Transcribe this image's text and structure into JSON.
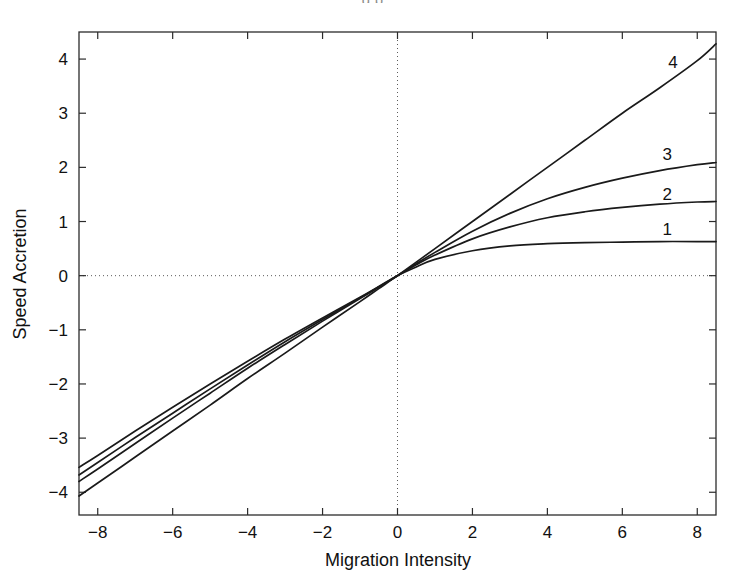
{
  "figure": {
    "background": "#ffffff",
    "ink_color": "#1a1a1a",
    "clipped_top_text": "g p"
  },
  "chart_data": {
    "type": "line",
    "title": "",
    "xlabel": "Migration Intensity",
    "ylabel": "Speed Accretion",
    "xlim": [
      -8.5,
      8.5
    ],
    "ylim": [
      -4.42,
      4.5
    ],
    "xticks": [
      -8,
      -6,
      -4,
      -2,
      0,
      2,
      4,
      6,
      8
    ],
    "xtick_labels": [
      "-8",
      "-6",
      "-4",
      "-2",
      "0",
      "2",
      "4",
      "6",
      "8"
    ],
    "yticks": [
      -4,
      -3,
      -2,
      -1,
      0,
      1,
      2,
      3,
      4
    ],
    "ytick_labels": [
      "-4",
      "-3",
      "-2",
      "-1",
      "0",
      "1",
      "2",
      "3",
      "4"
    ],
    "grid": false,
    "reference_lines": [
      {
        "axis": "x",
        "value": 0,
        "style": "dotted"
      },
      {
        "axis": "y",
        "value": 0,
        "style": "dotted"
      }
    ],
    "legend_position": "inline-right-end-labels",
    "x": [
      -8.5,
      -8,
      -7,
      -6,
      -5,
      -4,
      -3,
      -2,
      -1,
      -0.5,
      0,
      0.5,
      1,
      2,
      3,
      4,
      5,
      6,
      7,
      8,
      8.5
    ],
    "series": [
      {
        "name": "1",
        "label": "1",
        "label_x": 7.2,
        "label_y": 0.86,
        "color": "#1a1a1a",
        "values": [
          -3.54,
          -3.32,
          -2.87,
          -2.43,
          -2.0,
          -1.58,
          -1.17,
          -0.78,
          -0.4,
          -0.2,
          0.0,
          0.16,
          0.3,
          0.46,
          0.55,
          0.59,
          0.61,
          0.62,
          0.63,
          0.63,
          0.63
        ]
      },
      {
        "name": "2",
        "label": "2",
        "label_x": 7.2,
        "label_y": 1.5,
        "color": "#1a1a1a",
        "values": [
          -3.68,
          -3.45,
          -2.99,
          -2.54,
          -2.09,
          -1.65,
          -1.22,
          -0.81,
          -0.41,
          -0.21,
          0.0,
          0.2,
          0.38,
          0.68,
          0.9,
          1.07,
          1.18,
          1.26,
          1.32,
          1.36,
          1.37
        ]
      },
      {
        "name": "3",
        "label": "3",
        "label_x": 7.2,
        "label_y": 2.25,
        "color": "#1a1a1a",
        "values": [
          -3.8,
          -3.57,
          -3.1,
          -2.63,
          -2.17,
          -1.71,
          -1.27,
          -0.84,
          -0.42,
          -0.21,
          0.0,
          0.22,
          0.43,
          0.82,
          1.15,
          1.42,
          1.63,
          1.8,
          1.94,
          2.05,
          2.09
        ]
      },
      {
        "name": "4",
        "label": "4",
        "label_x": 7.35,
        "label_y": 3.95,
        "color": "#1a1a1a",
        "values": [
          -4.07,
          -3.83,
          -3.35,
          -2.87,
          -2.39,
          -1.9,
          -1.43,
          -0.95,
          -0.48,
          -0.24,
          0.0,
          0.25,
          0.5,
          1.0,
          1.5,
          2.0,
          2.5,
          3.0,
          3.47,
          3.97,
          4.28
        ]
      }
    ]
  }
}
